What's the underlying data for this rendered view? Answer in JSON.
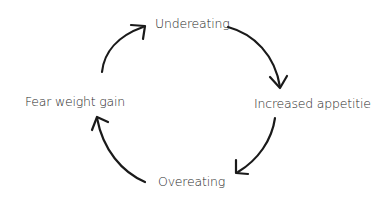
{
  "diagram": {
    "type": "cycle",
    "nodes": [
      {
        "id": "undereating",
        "label": "Undereating"
      },
      {
        "id": "increased-appetite",
        "label": "Increased appetitie"
      },
      {
        "id": "overeating",
        "label": "Overeating"
      },
      {
        "id": "fear-weight-gain",
        "label": "Fear weight gain"
      }
    ],
    "edges": [
      {
        "from": "undereating",
        "to": "increased-appetite"
      },
      {
        "from": "increased-appetite",
        "to": "overeating"
      },
      {
        "from": "overeating",
        "to": "fear-weight-gain"
      },
      {
        "from": "fear-weight-gain",
        "to": "undereating"
      }
    ],
    "colors": {
      "line": "#1a1a1a",
      "text": "#2a2a2a",
      "background": "#ffffff"
    }
  }
}
